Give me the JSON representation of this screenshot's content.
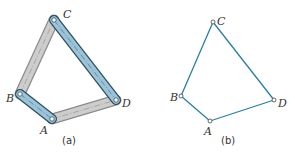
{
  "figures": [
    {
      "id": "a",
      "caption": "(a)",
      "description": "Physical four-bar linkage with links drawn as bars",
      "points": {
        "A": {
          "label": "A",
          "x": 52,
          "y": 119
        },
        "B": {
          "label": "B",
          "x": 20,
          "y": 94
        },
        "C": {
          "label": "C",
          "x": 54,
          "y": 20
        },
        "D": {
          "label": "D",
          "x": 116,
          "y": 100
        }
      },
      "links": [
        {
          "from": "B",
          "to": "C",
          "color": "gray"
        },
        {
          "from": "A",
          "to": "D",
          "color": "gray"
        },
        {
          "from": "C",
          "to": "D",
          "color": "blue"
        },
        {
          "from": "B",
          "to": "A",
          "color": "blue"
        }
      ]
    },
    {
      "id": "b",
      "caption": "(b)",
      "description": "Schematic four-bar linkage drawn as lines with pin joints",
      "points": {
        "A": {
          "label": "A",
          "x": 210,
          "y": 121
        },
        "B": {
          "label": "B",
          "x": 181,
          "y": 96
        },
        "C": {
          "label": "C",
          "x": 213,
          "y": 22
        },
        "D": {
          "label": "D",
          "x": 274,
          "y": 100
        }
      },
      "links": [
        {
          "from": "B",
          "to": "C"
        },
        {
          "from": "C",
          "to": "D"
        },
        {
          "from": "D",
          "to": "A"
        },
        {
          "from": "A",
          "to": "B"
        }
      ]
    }
  ],
  "colors": {
    "blue_link_fill": "#9cc3d8",
    "blue_link_edge": "#3f6f8a",
    "gray_link_fill": "#c9c9c9",
    "gray_link_edge": "#8c8c8c",
    "schematic_line": "#2a7fa3",
    "text": "#333333"
  }
}
